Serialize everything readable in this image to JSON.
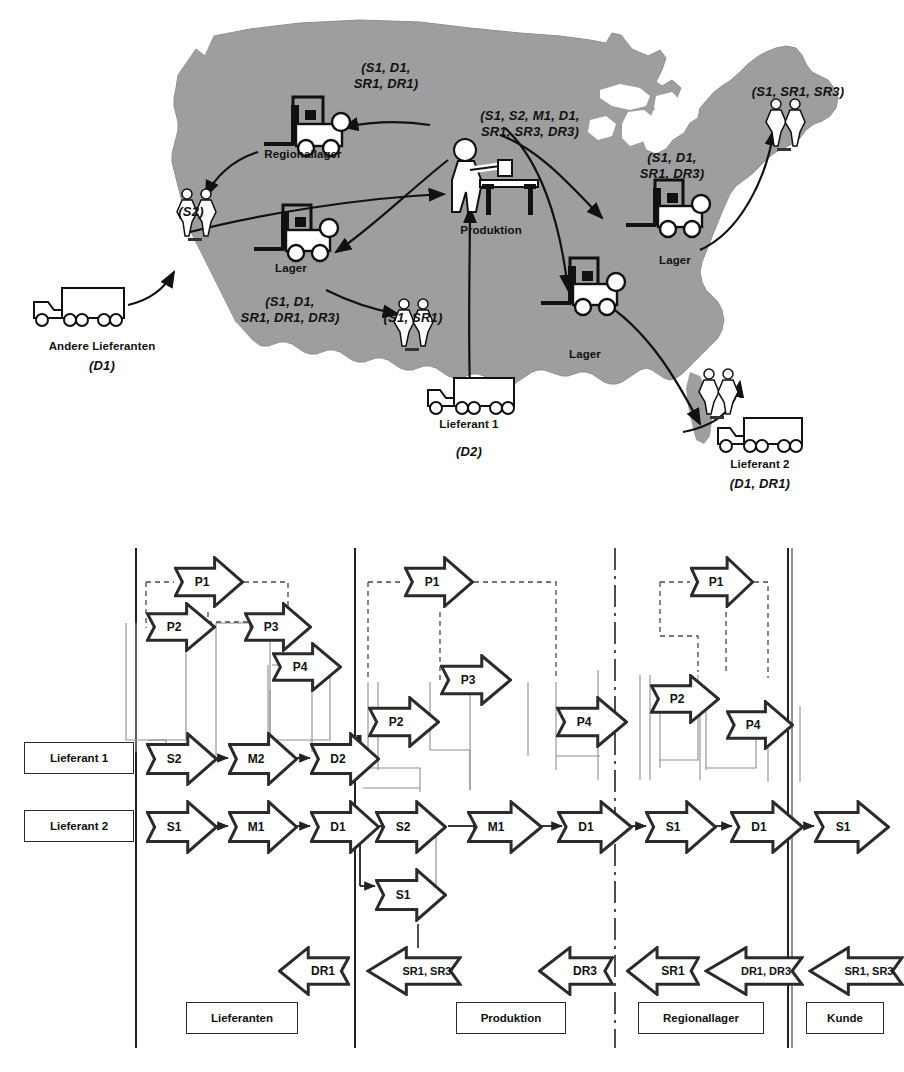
{
  "figure": {
    "colors": {
      "map_fill": "#9e9e9e",
      "map_stroke": "#8a8a8a",
      "ink": "#2b2b2b",
      "thin_line": "#8f8f8f",
      "dashed_line": "#4a4a4a",
      "white": "#ffffff"
    }
  },
  "map": {
    "nodes": [
      {
        "id": "andere-lieferanten",
        "label": "Andere Lieferanten",
        "codes": "(D1)",
        "icon": "truck-icon"
      },
      {
        "id": "regionallager",
        "label": "Regionallager",
        "codes": "(S1, D1,\nSR1, DR1)",
        "icon": "forklift-icon"
      },
      {
        "id": "produktion",
        "label": "Produktion",
        "codes": "(S1, S2, M1, D1,\nSR1, SR3, DR3)",
        "icon": "worker-bench-icon"
      },
      {
        "id": "lager-west",
        "label": "Lager",
        "codes": "(S1, D1,\nSR1, DR1, DR3)",
        "icon": "forklift-icon"
      },
      {
        "id": "lager-south",
        "label": "Lager",
        "codes": "",
        "icon": "forklift-icon"
      },
      {
        "id": "lager-east",
        "label": "Lager",
        "codes": "(S1, D1,\nSR1, DR3)",
        "icon": "forklift-icon"
      },
      {
        "id": "lieferant-1",
        "label": "Lieferant 1",
        "codes": "(D2)",
        "icon": "truck-icon"
      },
      {
        "id": "lieferant-2",
        "label": "Lieferant 2",
        "codes": "(D1, DR1)",
        "icon": "truck-icon"
      },
      {
        "id": "kunde-nw",
        "label": "",
        "codes": "(S2)",
        "icon": "customers-icon"
      },
      {
        "id": "kunde-central",
        "label": "",
        "codes": "(S1, SR1)",
        "icon": "customers-icon"
      },
      {
        "id": "kunde-ne",
        "label": "",
        "codes": "(S1, SR1, SR3)",
        "icon": "customers-icon"
      },
      {
        "id": "kunde-se",
        "label": "",
        "codes": "",
        "icon": "customers-icon"
      }
    ]
  },
  "scor": {
    "swimlane_labels": [
      {
        "id": "lieferant-1",
        "label": "Lieferant 1"
      },
      {
        "id": "lieferant-2",
        "label": "Lieferant 2"
      }
    ],
    "stage_labels": [
      {
        "id": "lieferanten",
        "label": "Lieferanten"
      },
      {
        "id": "produktion",
        "label": "Produktion"
      },
      {
        "id": "regionallager",
        "label": "Regionallager"
      },
      {
        "id": "kunde",
        "label": "Kunde"
      }
    ],
    "plan_arrows": [
      {
        "id": "p1-lieferanten",
        "label": "P1"
      },
      {
        "id": "p2-lieferanten",
        "label": "P2"
      },
      {
        "id": "p3-lieferanten",
        "label": "P3"
      },
      {
        "id": "p4-lieferanten",
        "label": "P4"
      },
      {
        "id": "p1-produktion",
        "label": "P1"
      },
      {
        "id": "p2-produktion",
        "label": "P2"
      },
      {
        "id": "p3-produktion",
        "label": "P3"
      },
      {
        "id": "p4-produktion",
        "label": "P4"
      },
      {
        "id": "p1-regionallager",
        "label": "P1"
      },
      {
        "id": "p2-regionallager",
        "label": "P2"
      },
      {
        "id": "p4-regionallager",
        "label": "P4"
      }
    ],
    "process_row_upper": [
      {
        "id": "s2-lieferant1",
        "label": "S2"
      },
      {
        "id": "m2-lieferant1",
        "label": "M2"
      },
      {
        "id": "d2-lieferant1",
        "label": "D2"
      }
    ],
    "process_row_lower": [
      {
        "id": "s1-lieferant2",
        "label": "S1"
      },
      {
        "id": "m1-lieferant2",
        "label": "M1"
      },
      {
        "id": "d1-lieferant2",
        "label": "D1"
      },
      {
        "id": "s2-produktion",
        "label": "S2"
      },
      {
        "id": "m1-produktion",
        "label": "M1"
      },
      {
        "id": "d1-produktion",
        "label": "D1"
      },
      {
        "id": "s1-regionallager",
        "label": "S1"
      },
      {
        "id": "d1-regionallager",
        "label": "D1"
      },
      {
        "id": "s1-kunde",
        "label": "S1"
      }
    ],
    "process_extra": [
      {
        "id": "s1-produktion-second",
        "label": "S1"
      }
    ],
    "return_arrows": [
      {
        "id": "dr1-lieferanten",
        "label": "DR1"
      },
      {
        "id": "sr1sr3-produktion-in",
        "label": "SR1, SR3"
      },
      {
        "id": "dr3-produktion",
        "label": "DR3"
      },
      {
        "id": "sr1-regionallager",
        "label": "SR1"
      },
      {
        "id": "dr1dr3-regionallager",
        "label": "DR1, DR3"
      },
      {
        "id": "sr1sr3-kunde",
        "label": "SR1, SR3"
      }
    ]
  }
}
